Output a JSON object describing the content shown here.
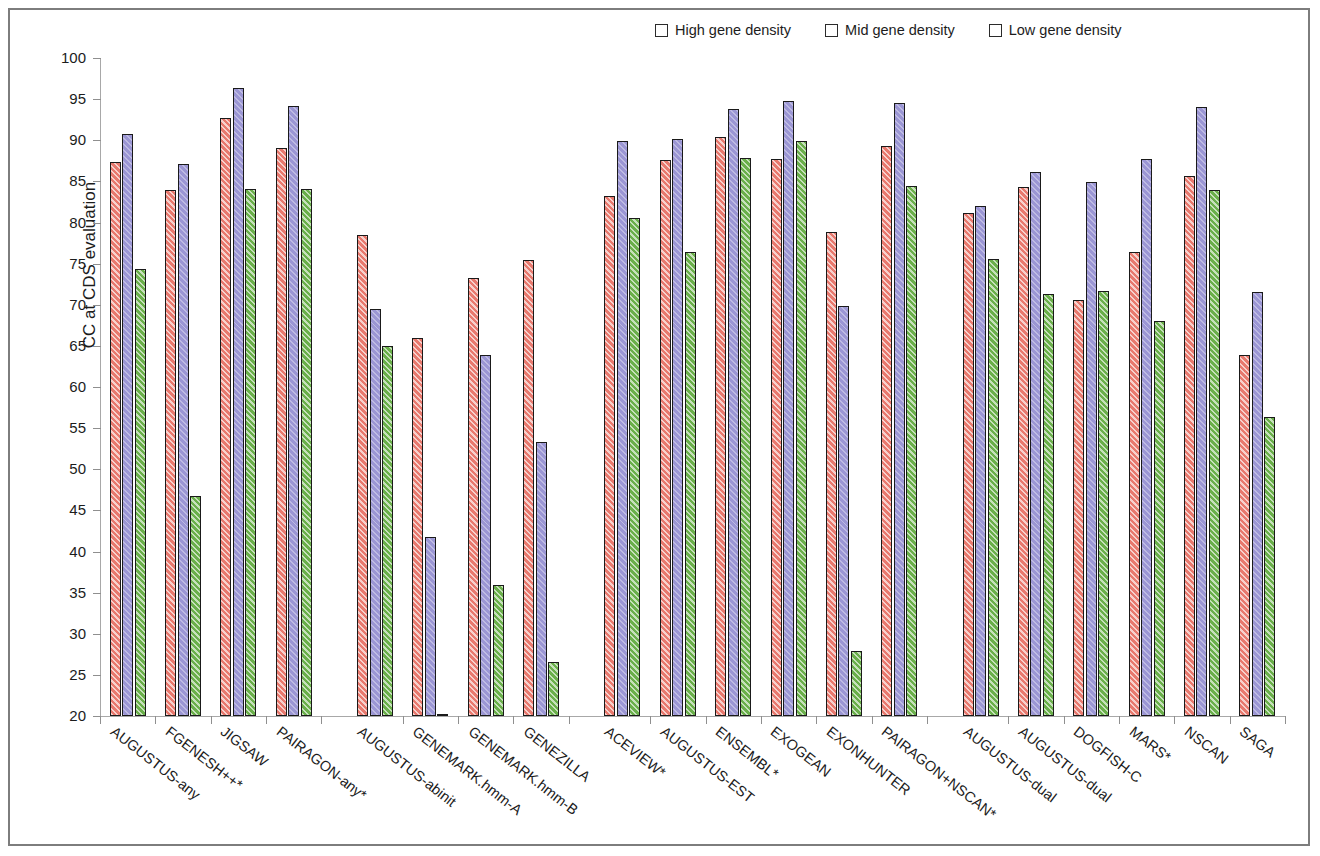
{
  "chart_data": {
    "type": "bar",
    "title": "",
    "xlabel": "",
    "ylabel": "CC at CDS evaluation",
    "ylim": [
      20,
      100
    ],
    "ytick_step": 5,
    "yticks": [
      100,
      95,
      90,
      85,
      80,
      75,
      70,
      65,
      60,
      55,
      50,
      45,
      40,
      35,
      30,
      25,
      20
    ],
    "grid": false,
    "legend_position": "top-right",
    "legend": [
      "High gene density",
      "Mid gene density",
      "Low gene density"
    ],
    "series": [
      {
        "name": "High gene density",
        "color": "#e8796e",
        "values": [
          87.4,
          83.9,
          92.7,
          89.1,
          78.5,
          66.0,
          73.3,
          75.4,
          83.2,
          87.6,
          90.4,
          87.7,
          78.8,
          89.3,
          81.2,
          84.3,
          70.6,
          76.4,
          85.6,
          63.9
        ]
      },
      {
        "name": "Mid gene density",
        "color": "#9b96d4",
        "values": [
          90.8,
          87.1,
          96.3,
          94.2,
          69.5,
          41.8,
          63.9,
          53.3,
          89.9,
          90.2,
          93.8,
          94.8,
          69.8,
          94.5,
          82.0,
          86.1,
          84.9,
          87.7,
          94.1,
          71.6
        ]
      },
      {
        "name": "Low gene density",
        "color": "#6aaf4a",
        "values": [
          74.3,
          46.8,
          84.1,
          84.1,
          65.0,
          20.2,
          35.9,
          26.6,
          80.5,
          76.4,
          87.8,
          89.9,
          27.9,
          84.4,
          75.6,
          71.3,
          71.7,
          68.0,
          84.0,
          56.4
        ]
      }
    ],
    "categories": [
      "AUGUSTUS-any",
      "FGENESH++*",
      "JIGSAW",
      "PAIRAGON-any*",
      "AUGUSTUS-abinit",
      "GENEMARK.hmm-A",
      "GENEMARK.hmm-B",
      "GENEZILLA",
      "ACEVIEW*",
      "AUGUSTUS-EST",
      "ENSEMBL*",
      "EXOGEAN",
      "EXONHUNTER",
      "PAIRAGON+NSCAN*",
      "AUGUSTUS-dual",
      "AUGUSTUS-dual",
      "DOGFISH-C",
      "MARS*",
      "NSCAN",
      "SAGA"
    ],
    "groups": [
      {
        "name": "group-1",
        "start": 0,
        "count": 4
      },
      {
        "name": "group-2",
        "start": 4,
        "count": 4
      },
      {
        "name": "group-3",
        "start": 8,
        "count": 6
      },
      {
        "name": "group-4",
        "start": 14,
        "count": 6
      }
    ]
  }
}
